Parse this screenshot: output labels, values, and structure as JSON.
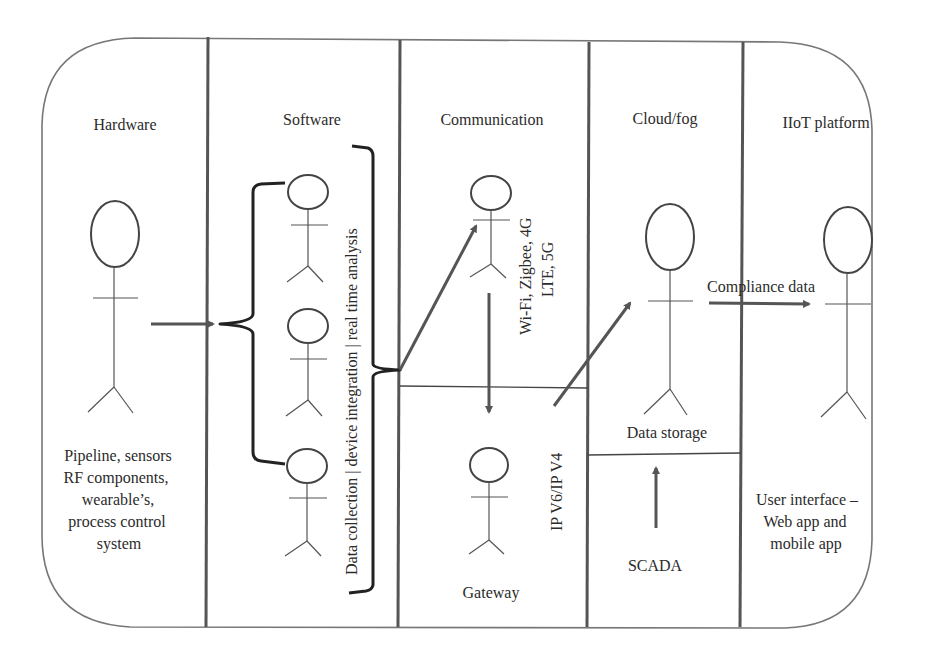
{
  "diagram": {
    "columns": [
      {
        "id": "hardware",
        "header": "Hardware",
        "description": [
          "Pipeline, sensors",
          "RF components,",
          "wearable’s,",
          "process control",
          "system"
        ]
      },
      {
        "id": "software",
        "header": "Software",
        "vertical_label": "Data collection | device integration | real time analysis"
      },
      {
        "id": "communication",
        "header": "Communication",
        "vertical_label": [
          "Wi-Fi, Zigbee, 4G",
          "LTE, 5G"
        ],
        "lower_label": "Gateway",
        "lower_vertical_label": "IP V6/IP V4"
      },
      {
        "id": "cloud",
        "header": "Cloud/fog",
        "upper_label": "Data storage",
        "lower_label": "SCADA"
      },
      {
        "id": "platform",
        "header": "IIoT platform",
        "description": [
          "User interface –",
          "Web app and",
          "mobile app"
        ]
      }
    ],
    "edge_labels": {
      "cloud_to_platform": "Compliance data"
    },
    "actors": [
      {
        "id": "hardware-actor",
        "column": "hardware"
      },
      {
        "id": "software-actor-1",
        "column": "software"
      },
      {
        "id": "software-actor-2",
        "column": "software"
      },
      {
        "id": "software-actor-3",
        "column": "software"
      },
      {
        "id": "communication-actor",
        "column": "communication"
      },
      {
        "id": "gateway-actor",
        "column": "communication"
      },
      {
        "id": "cloud-actor",
        "column": "cloud"
      },
      {
        "id": "platform-actor",
        "column": "platform"
      }
    ],
    "colors": {
      "frame": "#777777",
      "divider": "#555555",
      "arrow": "#555555",
      "text": "#2b2b2b"
    }
  }
}
